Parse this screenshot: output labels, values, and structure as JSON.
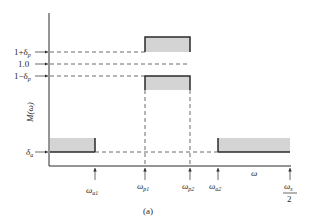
{
  "figure": {
    "caption": "(a)",
    "y_axis_label": "M(ω)",
    "x_axis_label": "ω",
    "y_ticks": {
      "upper_pass": "1+δ",
      "upper_pass_sub": "p",
      "unity": "1.0",
      "lower_pass": "1−δ",
      "lower_pass_sub": "p",
      "stop": "δ",
      "stop_sub": "a"
    },
    "x_ticks": {
      "stop_edge_1": "ω",
      "stop_edge_1_sub": "a1",
      "pass_edge_1": "ω",
      "pass_edge_1_sub": "p1",
      "pass_edge_2": "ω",
      "pass_edge_2_sub": "p2",
      "stop_edge_2": "ω",
      "stop_edge_2_sub": "a2",
      "nyquist_num": "ω",
      "nyquist_num_sub": "s",
      "nyquist_den": "2"
    },
    "colors": {
      "tolerance_fill": "#d4d4d4",
      "line": "#2a2a2a",
      "dashed": "#444444"
    }
  }
}
